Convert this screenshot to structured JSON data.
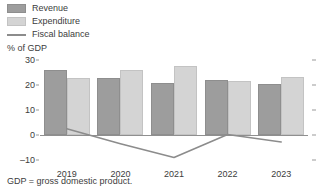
{
  "chart_data": {
    "type": "bar",
    "title": "",
    "subtitle": "",
    "xlabel": "",
    "ylabel": "% of GDP",
    "categories": [
      "2019",
      "2020",
      "2021",
      "2022",
      "2023"
    ],
    "ylim": [
      -10,
      30
    ],
    "yticks": [
      -10,
      0,
      10,
      20,
      30
    ],
    "ytick_labels": [
      "–10",
      "0",
      "10",
      "20",
      "30"
    ],
    "grid": false,
    "legend_position": "top-left",
    "series": [
      {
        "name": "Revenue",
        "type": "bar",
        "color": "#9d9d9d",
        "values": [
          26.0,
          23.0,
          21.0,
          22.0,
          20.5
        ]
      },
      {
        "name": "Expenditure",
        "type": "bar",
        "color": "#d4d4d4",
        "values": [
          23.0,
          26.0,
          27.5,
          21.7,
          23.3
        ]
      },
      {
        "name": "Fiscal balance",
        "type": "line",
        "color": "#8c8c8c",
        "values": [
          2.5,
          -3.5,
          -9.0,
          0.2,
          -2.8
        ]
      }
    ],
    "annotations": [
      "GDP = gross domestic product."
    ]
  },
  "legend": {
    "items": [
      {
        "label": "Revenue",
        "key": "swatch"
      },
      {
        "label": "Expenditure",
        "key": "swatch"
      },
      {
        "label": "Fiscal balance",
        "key": "line"
      }
    ]
  },
  "axis": {
    "y_title": "% of GDP"
  },
  "footnote": {
    "text": "GDP = gross domestic product."
  }
}
